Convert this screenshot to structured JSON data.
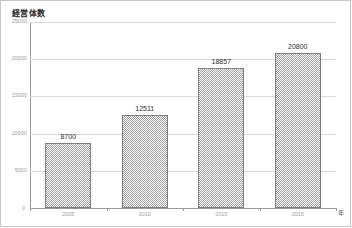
{
  "chart_data": {
    "type": "bar",
    "title": "経営体数",
    "xlabel": "年",
    "ylabel": "",
    "categories": [
      "2005",
      "2010",
      "2015",
      "2016"
    ],
    "values": [
      8700,
      12511,
      18857,
      20800
    ],
    "data_labels": [
      "8700",
      "12511",
      "18857",
      "20800"
    ],
    "ylim": [
      0,
      25000
    ],
    "yticks": [
      0,
      5000,
      10000,
      15000,
      20000,
      25000
    ],
    "ytick_labels": [
      "0",
      "5000",
      "10000",
      "15000",
      "20000",
      "25000"
    ],
    "grid": true,
    "legend": false,
    "series": [
      {
        "name": "経営体数",
        "values": [
          8700,
          12511,
          18857,
          20800
        ]
      }
    ],
    "bar_fill": "#9e9e9e",
    "bar_border": "#7d7d7d",
    "gridline_color": "#d9d9d9",
    "axis_color": "#9a9a9a",
    "text_color": "#2b2b2b",
    "tick_text_color": "#9b9b9b"
  },
  "axis": {
    "origin_label": "0",
    "x_unit": "年"
  }
}
